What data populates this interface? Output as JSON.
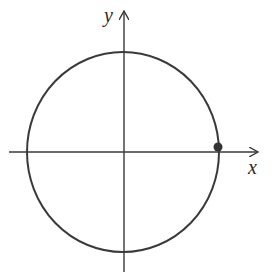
{
  "diagram": {
    "type": "unit-circle",
    "axes": {
      "x_label": "x",
      "y_label": "y"
    },
    "circle": {
      "cx": 123,
      "cy": 152,
      "rx": 96,
      "ry": 100
    },
    "point": {
      "label": "",
      "position": "on circle near positive x-axis, slightly above",
      "cx": 218,
      "cy": 147
    },
    "colors": {
      "stroke": "#3a3a3a",
      "point": "#333333",
      "background": "#ffffff"
    }
  }
}
